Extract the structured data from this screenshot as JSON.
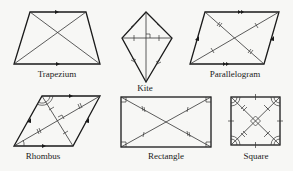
{
  "figure": {
    "shapes": [
      {
        "name": "trapezium",
        "label": "Trapezium",
        "properties": [
          "one pair of parallel sides",
          "diagonals"
        ]
      },
      {
        "name": "kite",
        "label": "Kite",
        "properties": [
          "two pairs of adjacent equal sides",
          "diagonals perpendicular",
          "one diagonal bisected"
        ]
      },
      {
        "name": "parallelogram",
        "label": "Parallelogram",
        "properties": [
          "two pairs of parallel sides",
          "diagonals bisect each other"
        ]
      },
      {
        "name": "rhombus",
        "label": "Rhombus",
        "properties": [
          "all sides parallel in pairs",
          "diagonals bisect at right angles",
          "diagonals bisect angles"
        ]
      },
      {
        "name": "rectangle",
        "label": "Rectangle",
        "properties": [
          "four right angles",
          "equal diagonals bisect each other"
        ]
      },
      {
        "name": "square",
        "label": "Square",
        "properties": [
          "four right angles",
          "equal sides",
          "diagonals bisect at right angles",
          "diagonals bisect angles"
        ]
      }
    ]
  },
  "colors": {
    "line": "#1a1a1a",
    "background": "#f7f7f5"
  }
}
